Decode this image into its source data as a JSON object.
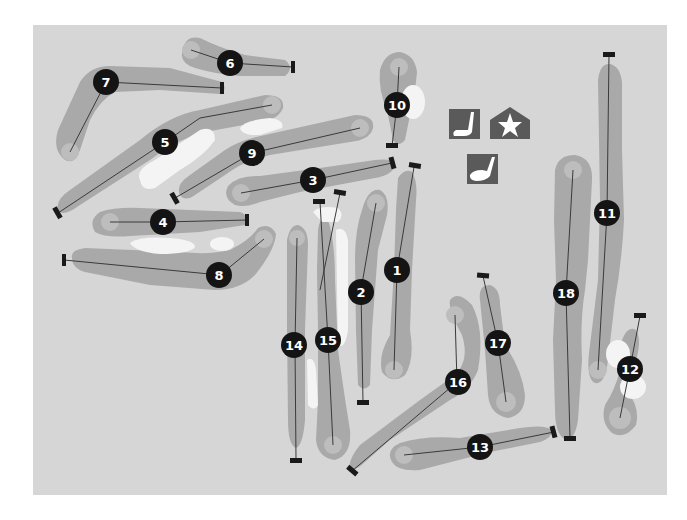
{
  "map": {
    "title": "Golf course layout",
    "colors": {
      "background": "#d6d6d6",
      "fairway": "#a9a9a9",
      "green": "#bdbdbd",
      "bunker": "#f4f4f4",
      "badge": "#141414",
      "icon": "#5a5a5a"
    },
    "holes": [
      {
        "number": "1",
        "label": "1"
      },
      {
        "number": "2",
        "label": "2"
      },
      {
        "number": "3",
        "label": "3"
      },
      {
        "number": "4",
        "label": "4"
      },
      {
        "number": "5",
        "label": "5"
      },
      {
        "number": "6",
        "label": "6"
      },
      {
        "number": "7",
        "label": "7"
      },
      {
        "number": "8",
        "label": "8"
      },
      {
        "number": "9",
        "label": "9"
      },
      {
        "number": "10",
        "label": "10"
      },
      {
        "number": "11",
        "label": "11"
      },
      {
        "number": "12",
        "label": "12"
      },
      {
        "number": "13",
        "label": "13"
      },
      {
        "number": "14",
        "label": "14"
      },
      {
        "number": "15",
        "label": "15"
      },
      {
        "number": "16",
        "label": "16"
      },
      {
        "number": "17",
        "label": "17"
      },
      {
        "number": "18",
        "label": "18"
      }
    ],
    "legend_icons": [
      {
        "name": "putting-green-icon"
      },
      {
        "name": "clubhouse-icon"
      },
      {
        "name": "driving-range-icon"
      }
    ]
  }
}
